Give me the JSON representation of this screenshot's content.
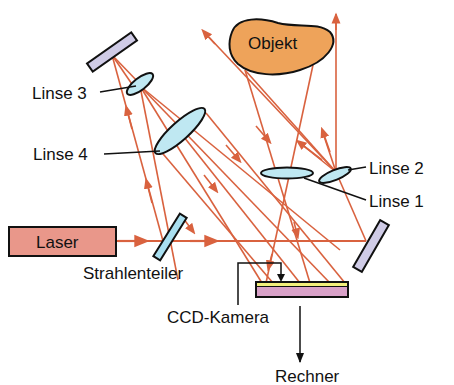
{
  "labels": {
    "laser": "Laser",
    "beam_splitter": "Strahlenteiler",
    "lens_1": "Linse 1",
    "lens_2": "Linse 2",
    "lens_3": "Linse 3",
    "lens_4": "Linse 4",
    "object": "Objekt",
    "ccd_camera": "CCD-Kamera",
    "computer": "Rechner"
  },
  "colors": {
    "laser_fill": "#e9978a",
    "object_fill": "#eea35a",
    "lens_fill": "#bfe8f2",
    "beam_splitter_fill": "#a9dff0",
    "mirror_fill": "#cfcbe6",
    "ccd_fill": "#d9a1c8",
    "ccd_sensor": "#f2ef7a",
    "ray": "#d9623f",
    "outline": "#111111"
  },
  "components": [
    {
      "id": "laser",
      "type": "source"
    },
    {
      "id": "beam_splitter",
      "type": "beam-splitter"
    },
    {
      "id": "mirror_top_left",
      "type": "mirror"
    },
    {
      "id": "mirror_right",
      "type": "mirror"
    },
    {
      "id": "lens_1",
      "type": "lens"
    },
    {
      "id": "lens_2",
      "type": "lens"
    },
    {
      "id": "lens_3",
      "type": "lens"
    },
    {
      "id": "lens_4",
      "type": "lens"
    },
    {
      "id": "object",
      "type": "object"
    },
    {
      "id": "ccd_camera",
      "type": "detector"
    },
    {
      "id": "computer",
      "type": "output"
    }
  ]
}
